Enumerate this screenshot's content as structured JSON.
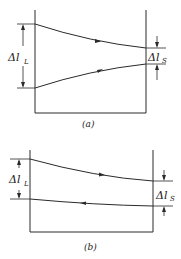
{
  "diagram_a": {
    "caption": "(a)",
    "left_label": "Δl",
    "left_label_sub": "L",
    "right_label": "Δl",
    "right_label_sub": "S",
    "upper_curve_direction": "right",
    "lower_curve_direction": "right"
  },
  "diagram_b": {
    "caption": "(b)",
    "left_label": "Δl",
    "left_label_sub": "L",
    "right_label": "Δl",
    "right_label_sub": "S",
    "upper_curve_direction": "right",
    "lower_curve_direction": "left"
  },
  "colors": {
    "line": "#2a2a2a",
    "background": "#ffffff"
  }
}
